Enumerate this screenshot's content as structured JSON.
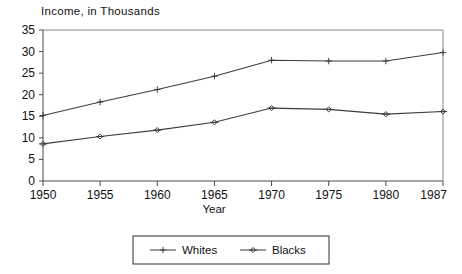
{
  "chart_data": {
    "type": "line",
    "title": "Income, in Thousands",
    "xlabel": "Year",
    "ylabel": "",
    "x": [
      1950,
      1955,
      1960,
      1965,
      1970,
      1975,
      1980,
      1987
    ],
    "categories": [
      "1950",
      "1955",
      "1960",
      "1965",
      "1970",
      "1975",
      "1980",
      "1987"
    ],
    "xlim": [
      1950,
      1987
    ],
    "ylim": [
      0,
      35
    ],
    "ytick_labels": [
      "0",
      "5",
      "10",
      "15",
      "20",
      "25",
      "30",
      "35"
    ],
    "ytick_values": [
      0,
      5,
      10,
      15,
      20,
      25,
      30,
      35
    ],
    "grid": false,
    "legend_position": "bottom-center",
    "series": [
      {
        "name": "Whites",
        "marker": "plus",
        "color": "#3c3c3c",
        "values": [
          15.2,
          18.3,
          21.2,
          24.3,
          28.0,
          27.8,
          27.8,
          29.8
        ]
      },
      {
        "name": "Blacks",
        "marker": "diamond",
        "color": "#3c3c3c",
        "values": [
          8.6,
          10.3,
          11.8,
          13.6,
          16.9,
          16.6,
          15.5,
          16.1
        ]
      }
    ]
  },
  "legend": {
    "entries": [
      {
        "label": "Whites"
      },
      {
        "label": "Blacks"
      }
    ]
  }
}
